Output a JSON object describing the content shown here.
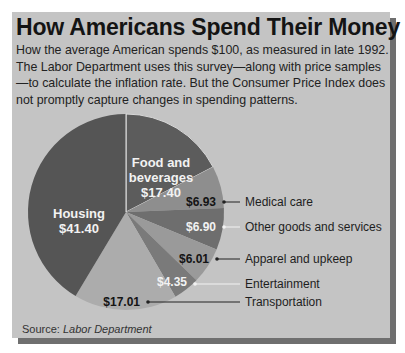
{
  "title": "How Americans Spend Their Money",
  "subtitle_lines": [
    "How the average American spends $100, as measured in late 1992.",
    "The Labor Department uses this survey—along with price samples",
    "—to calculate the inflation rate. But the Consumer Price Index does",
    "not promptly capture changes in spending patterns."
  ],
  "source": {
    "label": "Source:",
    "value": "Labor Department"
  },
  "colors": {
    "panel": "#c4c4c4",
    "shadow": "#6f6f6f",
    "text": "#141414"
  },
  "chart_data": {
    "type": "pie",
    "title": "How Americans Spend Their Money",
    "unit": "USD per $100 spent",
    "start_angle_deg": 0,
    "direction": "clockwise",
    "slices": [
      {
        "label": "Food and beverages",
        "value": 17.4,
        "display": "$17.40",
        "color": "#5c5c5c",
        "label_inside": true
      },
      {
        "label": "Medical care",
        "value": 6.93,
        "display": "$6.93",
        "color": "#8e8e8e",
        "label_inside": false
      },
      {
        "label": "Other goods and services",
        "value": 6.9,
        "display": "$6.90",
        "color": "#6e6e6e",
        "label_inside": false
      },
      {
        "label": "Apparel and upkeep",
        "value": 6.01,
        "display": "$6.01",
        "color": "#9a9a9a",
        "label_inside": false
      },
      {
        "label": "Entertainment",
        "value": 4.35,
        "display": "$4.35",
        "color": "#7a7a7a",
        "label_inside": false
      },
      {
        "label": "Transportation",
        "value": 17.01,
        "display": "$17.01",
        "color": "#acacac",
        "label_inside": false
      },
      {
        "label": "Housing",
        "value": 41.4,
        "display": "$41.40",
        "color": "#555555",
        "label_inside": true
      }
    ],
    "total": 100.0,
    "legend": "callout labels to the right of the pie"
  }
}
